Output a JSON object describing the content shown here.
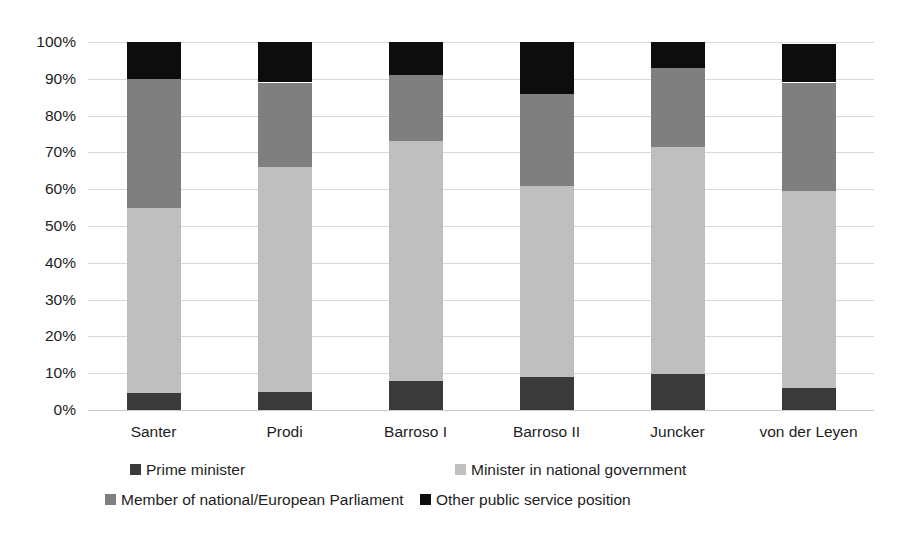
{
  "chart_data": {
    "type": "bar",
    "subtype": "stacked-100-percent",
    "title": "",
    "xlabel": "",
    "ylabel": "",
    "categories": [
      "Santer",
      "Prodi",
      "Barroso I",
      "Barroso II",
      "Juncker",
      "von der Leyen"
    ],
    "ylim": [
      0,
      100
    ],
    "y_tick_labels": [
      "0%",
      "10%",
      "20%",
      "30%",
      "40%",
      "50%",
      "60%",
      "70%",
      "80%",
      "90%",
      "100%"
    ],
    "y_tick_values": [
      0,
      10,
      20,
      30,
      40,
      50,
      60,
      70,
      80,
      90,
      100
    ],
    "grid": true,
    "legend_position": "bottom",
    "series": [
      {
        "name": "Prime minister",
        "color": "#3a3a3a",
        "values": [
          4.5,
          5.0,
          8.0,
          9.0,
          9.8,
          6.0
        ]
      },
      {
        "name": "Minister in national government",
        "color": "#bfbfbf",
        "values": [
          50.5,
          61.0,
          65.0,
          52.0,
          61.7,
          53.5
        ]
      },
      {
        "name": "Member of national/European Parliament",
        "color": "#7f7f7f",
        "values": [
          35.0,
          23.0,
          18.0,
          25.0,
          21.5,
          29.5
        ]
      },
      {
        "name": "Other public service position",
        "color": "#0d0d0d",
        "values": [
          10.0,
          11.0,
          9.0,
          14.0,
          7.0,
          10.5
        ]
      }
    ],
    "cumulative_tops": [
      [
        4.5,
        55.0,
        90.0,
        100.0
      ],
      [
        5.0,
        66.0,
        89.0,
        100.0
      ],
      [
        8.0,
        73.0,
        91.0,
        100.0
      ],
      [
        9.0,
        61.0,
        86.0,
        100.0
      ],
      [
        9.8,
        71.5,
        93.0,
        100.0
      ],
      [
        6.0,
        59.5,
        89.0,
        99.5
      ]
    ]
  },
  "colors": {
    "gridline": "#d9d9d9",
    "background": "#ffffff",
    "text": "#1d1d1d"
  },
  "legend": {
    "items": [
      {
        "label": "Prime minister",
        "color": "#3a3a3a",
        "icon": "square-swatch-icon"
      },
      {
        "label": "Minister in national government",
        "color": "#bfbfbf",
        "icon": "square-swatch-icon"
      },
      {
        "label": "Member of national/European Parliament",
        "color": "#7f7f7f",
        "icon": "square-swatch-icon"
      },
      {
        "label": "Other public service position",
        "color": "#0d0d0d",
        "icon": "square-swatch-icon"
      }
    ]
  }
}
